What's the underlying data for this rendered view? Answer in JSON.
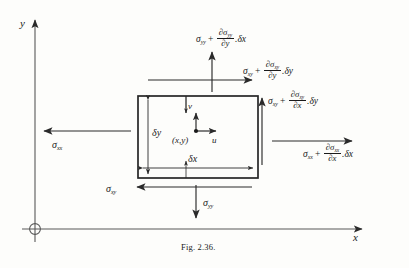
{
  "figure": {
    "caption": "Fig. 2.36.",
    "axes": {
      "y_label": "y",
      "x_label": "x",
      "origin_marker": "circled-origin"
    }
  },
  "element": {
    "center_point_label": "(x,y)",
    "velocity_u_label": "u",
    "velocity_v_label": "v",
    "width_label": "δx",
    "height_label": "δy"
  },
  "stresses": {
    "top_normal": {
      "base": "σ",
      "base_sub": "yy",
      "op": "+",
      "num_d": "∂σ",
      "num_sub": "yy",
      "den_d": "∂y",
      "tail": ".δx",
      "direction": "up"
    },
    "top_shear": {
      "base": "σ",
      "base_sub": "xy",
      "op": "+",
      "num_d": "∂σ",
      "num_sub": "xy",
      "den_d": "∂y",
      "tail": ".δy",
      "direction": "right"
    },
    "right_shear": {
      "base": "σ",
      "base_sub": "xy",
      "op": "+",
      "num_d": "∂σ",
      "num_sub": "xy",
      "den_d": "∂x",
      "tail": ".δy",
      "direction": "up"
    },
    "right_normal": {
      "base": "σ",
      "base_sub": "xx",
      "op": "+",
      "num_d": "∂σ",
      "num_sub": "xx",
      "den_d": "∂x",
      "tail": ".δx",
      "direction": "right"
    },
    "left_normal": {
      "base": "σ",
      "base_sub": "xx",
      "direction": "left"
    },
    "bottom_shear": {
      "base": "σ",
      "base_sub": "xy",
      "direction": "left"
    },
    "bottom_normal": {
      "base": "σ",
      "base_sub": "yy",
      "direction": "down"
    }
  },
  "colors": {
    "ink": "#1a1a1a",
    "paper": "#fdfdfb",
    "axis": "#4a4a4a"
  }
}
